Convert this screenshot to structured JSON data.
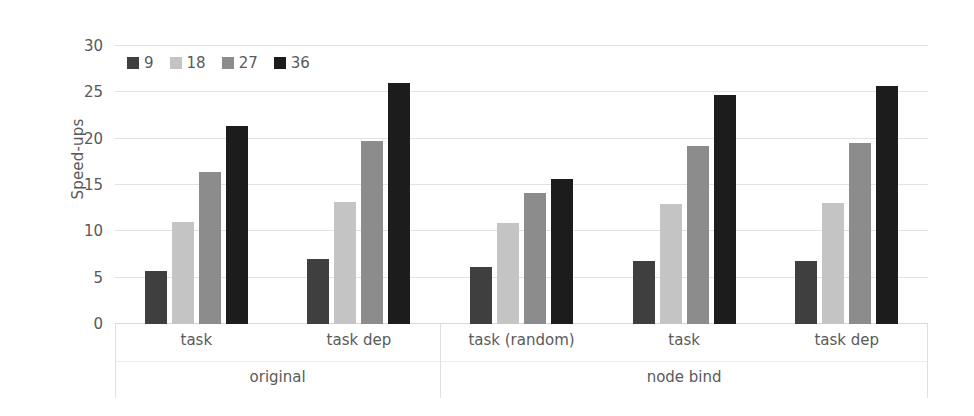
{
  "chart_data": {
    "type": "bar",
    "title": "",
    "xlabel": "",
    "ylabel": "Speed-ups",
    "ylim": [
      0,
      30
    ],
    "yticks": [
      0,
      5,
      10,
      15,
      20,
      25,
      30
    ],
    "grid": true,
    "legend_position": "top-left",
    "legend_title": "",
    "series": [
      {
        "name": "9",
        "color": "#3f3f3f",
        "values": [
          5.7,
          7.0,
          6.2,
          6.8,
          6.8
        ]
      },
      {
        "name": "18",
        "color": "#c4c4c4",
        "values": [
          11.0,
          13.2,
          10.9,
          13.0,
          13.1
        ]
      },
      {
        "name": "27",
        "color": "#8c8c8c",
        "values": [
          16.4,
          19.7,
          14.1,
          19.2,
          19.5
        ]
      },
      {
        "name": "36",
        "color": "#1c1c1c",
        "values": [
          21.4,
          26.0,
          15.6,
          24.7,
          25.7
        ]
      }
    ],
    "categories": [
      "task",
      "task dep",
      "task (random)",
      "task",
      "task dep"
    ],
    "group_labels": [
      "original",
      "node bind"
    ],
    "group_spans": [
      2,
      3
    ]
  },
  "axis": {
    "y_title": "Speed-ups",
    "y_tick_labels": [
      "30",
      "25",
      "20",
      "15",
      "10",
      "5",
      "0"
    ]
  },
  "legend": {
    "items": [
      {
        "label": "9",
        "color": "#3f3f3f"
      },
      {
        "label": "18",
        "color": "#c4c4c4"
      },
      {
        "label": "27",
        "color": "#8c8c8c"
      },
      {
        "label": "36",
        "color": "#1c1c1c"
      }
    ]
  },
  "colors": {
    "background": "#ffffff",
    "gridline": "#e2e2e2",
    "text": "#5a5a5a",
    "separator": "#e0e0e0"
  }
}
